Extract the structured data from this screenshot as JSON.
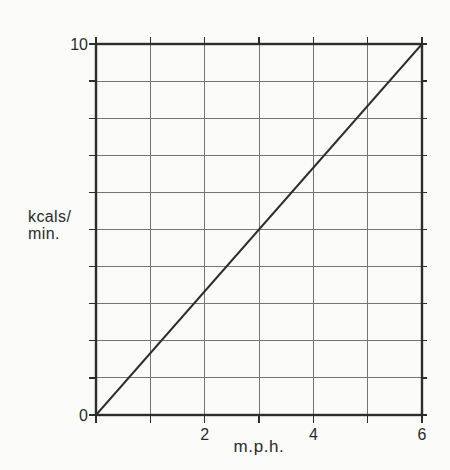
{
  "chart_data": {
    "type": "line",
    "title": "",
    "xlabel": "m.p.h.",
    "ylabel": "kcals/min.",
    "ylabel_lines": [
      "kcals/",
      "min."
    ],
    "xlim": [
      0,
      6
    ],
    "ylim": [
      0,
      10
    ],
    "x_grid_step": 1,
    "y_grid_step": 1,
    "grid": true,
    "legend": "none",
    "x_ticks": [
      {
        "value": 2,
        "label": "2"
      },
      {
        "value": 4,
        "label": "4"
      },
      {
        "value": 6,
        "label": "6"
      }
    ],
    "y_ticks": [
      {
        "value": 0,
        "label": "0"
      },
      {
        "value": 10,
        "label": "10"
      }
    ],
    "series": [
      {
        "name": "kcals-per-min-vs-speed",
        "points": [
          [
            0,
            0
          ],
          [
            6,
            10
          ]
        ]
      }
    ],
    "colors": {
      "background": "#fbfbf9",
      "grid": "#757575",
      "border": "#2d2d2d",
      "line": "#2d2d2d",
      "text": "#2a2a2a"
    }
  }
}
